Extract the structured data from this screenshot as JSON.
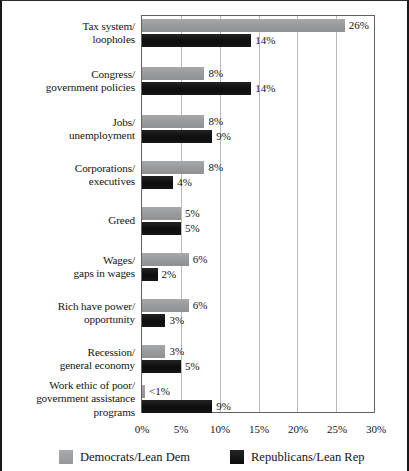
{
  "chart_data": {
    "type": "bar",
    "orientation": "horizontal",
    "title": "",
    "xlabel": "",
    "ylabel": "",
    "xlim": [
      0,
      30
    ],
    "xtick_labels": [
      "0%",
      "5%",
      "10%",
      "15%",
      "20%",
      "25%",
      "30%"
    ],
    "xtick_values": [
      0,
      5,
      10,
      15,
      20,
      25,
      30
    ],
    "grid": true,
    "grid_axis": "x",
    "legend_position": "bottom",
    "categories": [
      "Tax system/\nloopholes",
      "Congress/\ngovernment policies",
      "Jobs/\nunemployment",
      "Corporations/\nexecutives",
      "Greed",
      "Wages/\ngaps in wages",
      "Rich have power/\nopportunity",
      "Recession/\ngeneral economy",
      "Work ethic of poor/\ngovernment assistance\nprograms"
    ],
    "series": [
      {
        "name": "Democrats/Lean Dem",
        "color": "#9b9d9f",
        "values": [
          26,
          8,
          8,
          8,
          5,
          6,
          6,
          3,
          0.4
        ],
        "value_labels": [
          "26%",
          "8%",
          "8%",
          "8%",
          "5%",
          "6%",
          "6%",
          "3%",
          "<1%"
        ]
      },
      {
        "name": "Republicans/Lean Rep",
        "color": "#131313",
        "values": [
          14,
          14,
          9,
          4,
          5,
          2,
          3,
          5,
          9
        ],
        "value_labels": [
          "14%",
          "14%",
          "9%",
          "4%",
          "5%",
          "2%",
          "3%",
          "5%",
          "9%"
        ]
      }
    ]
  },
  "legend": {
    "items": [
      {
        "label": "Democrats/Lean Dem",
        "swatch": "dem-swatch"
      },
      {
        "label": "Republicans/Lean Rep",
        "swatch": "rep-swatch"
      }
    ]
  }
}
